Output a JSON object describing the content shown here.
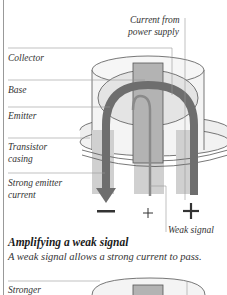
{
  "diagram": {
    "labels": {
      "current_from": "Current from",
      "power_supply": "power supply",
      "collector": "Collector",
      "base": "Base",
      "emitter": "Emitter",
      "transistor": "Transistor",
      "casing": "casing",
      "strong_emitter": "Strong emitter",
      "current": "current",
      "weak_signal": "Weak signal",
      "stronger": "Stronger"
    },
    "symbols": {
      "minus": "−",
      "plus_small": "+",
      "plus_large": "+"
    },
    "colors": {
      "arrow": "#6e6e6e",
      "core": "#b3b3b3",
      "light_fill": "#e6e6e6",
      "outline": "#555555"
    }
  },
  "caption": {
    "title": "Amplifying a weak signal",
    "text": "A weak signal allows a strong current to pass."
  }
}
